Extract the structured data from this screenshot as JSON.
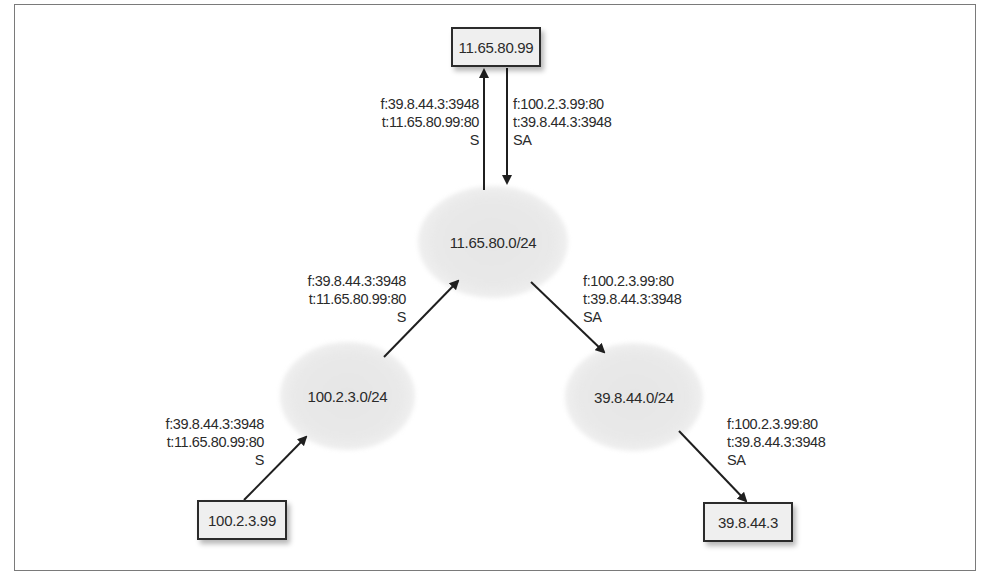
{
  "diagram": {
    "hosts": {
      "server": {
        "label": "11.65.80.99"
      },
      "client": {
        "label": "100.2.3.99"
      },
      "receiver": {
        "label": "39.8.44.3"
      }
    },
    "networks": {
      "server_net": {
        "label": "11.65.80.0/24"
      },
      "client_net": {
        "label": "100.2.3.0/24"
      },
      "receiver_net": {
        "label": "39.8.44.0/24"
      }
    },
    "packets": {
      "client_to_client_net": {
        "from": "f:39.8.44.3:3948",
        "to": "t:11.65.80.99:80",
        "flags": "S"
      },
      "client_net_to_server_net": {
        "from": "f:39.8.44.3:3948",
        "to": "t:11.65.80.99:80",
        "flags": "S"
      },
      "server_net_to_server": {
        "from": "f:39.8.44.3:3948",
        "to": "t:11.65.80.99:80",
        "flags": "S"
      },
      "server_to_server_net": {
        "from": "f:100.2.3.99:80",
        "to": "t:39.8.44.3:3948",
        "flags": "SA"
      },
      "server_net_to_receiver_net": {
        "from": "f:100.2.3.99:80",
        "to": "t:39.8.44.3:3948",
        "flags": "SA"
      },
      "receiver_net_to_receiver": {
        "from": "f:100.2.3.99:80",
        "to": "t:39.8.44.3:3948",
        "flags": "SA"
      }
    },
    "colors": {
      "host_fill": "#efefef",
      "host_border": "#2b2b2b",
      "cloud_fill": "#e6e6e6",
      "arrow": "#1f1f1f",
      "frame": "#7a7a7a"
    }
  }
}
